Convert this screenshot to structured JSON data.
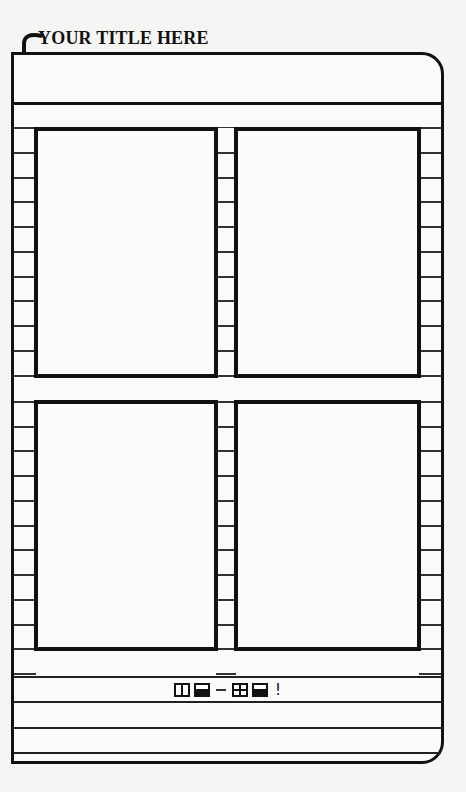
{
  "header": {
    "title": "YOUR TITLE HERE",
    "arrow_icon": "curved-down-arrow"
  },
  "layout": {
    "panels": [
      {
        "id": "top-left",
        "row": 1,
        "col": 1
      },
      {
        "id": "top-right",
        "row": 1,
        "col": 2
      },
      {
        "id": "bottom-left",
        "row": 2,
        "col": 1
      },
      {
        "id": "bottom-right",
        "row": 2,
        "col": 2
      }
    ],
    "footer_lines": 4
  },
  "footer": {
    "symbols": [
      "two-panel-box",
      "half-filled-box",
      "dash",
      "four-panel-box",
      "half-filled-box"
    ],
    "exclamation": "!"
  },
  "colors": {
    "ink": "#111111",
    "paper": "#fbfbfa"
  }
}
